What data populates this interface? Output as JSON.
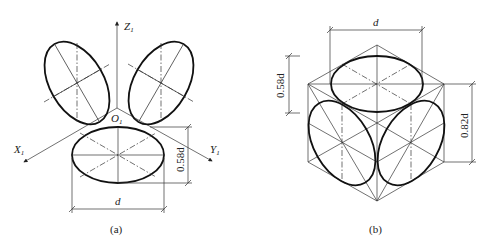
{
  "figure_a": {
    "caption": "(a)",
    "axes": {
      "z_label": "Z",
      "z_sub": "1",
      "x_label": "X",
      "x_sub": "1",
      "y_label": "Y",
      "y_sub": "1",
      "origin_label": "O",
      "origin_sub": "1"
    },
    "dimensions": {
      "width_label": "d",
      "height_label": "0.58d"
    }
  },
  "figure_b": {
    "caption": "(b)",
    "dimensions": {
      "top_width_label": "d",
      "left_height_label": "0.58d",
      "right_height_label": "0.82d"
    }
  }
}
